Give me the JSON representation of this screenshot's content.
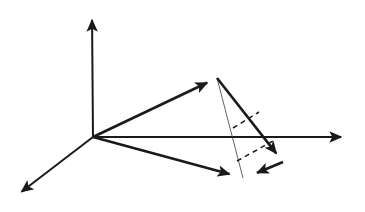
{
  "figure": {
    "type": "line-diagram",
    "background_color": "#ffffff",
    "width": 365,
    "height": 212,
    "origin": {
      "x": 93,
      "y": 137,
      "label": "O"
    }
  },
  "chart_data": {
    "type": "line",
    "title": "",
    "xlabel": "",
    "ylabel": "",
    "grid": false,
    "legend": "none",
    "axes": [
      {
        "name": "y-axis",
        "direction": "up",
        "from": {
          "x": 93,
          "y": 137
        },
        "to": {
          "x": 92,
          "y": 13
        },
        "arrow": true,
        "stroke": "#1a1a1a",
        "width": 2.0
      },
      {
        "name": "x-axis",
        "direction": "right",
        "from": {
          "x": 93,
          "y": 137
        },
        "to": {
          "x": 348,
          "y": 137
        },
        "arrow": true,
        "stroke": "#1a1a1a",
        "width": 2.0
      },
      {
        "name": "z-axis",
        "direction": "down-left",
        "from": {
          "x": 93,
          "y": 137
        },
        "to": {
          "x": 16,
          "y": 196
        },
        "arrow": true,
        "stroke": "#1a1a1a",
        "width": 2.0
      }
    ],
    "vectors": [
      {
        "name": "upper-vector",
        "from": {
          "x": 93,
          "y": 137
        },
        "to": {
          "x": 217,
          "y": 78
        },
        "arrow": true,
        "stroke": "#1a1a1a",
        "width": 2.6,
        "style": "solid"
      },
      {
        "name": "lower-vector",
        "from": {
          "x": 93,
          "y": 137
        },
        "to": {
          "x": 240,
          "y": 177
        },
        "arrow": true,
        "stroke": "#1a1a1a",
        "width": 2.6,
        "style": "solid"
      }
    ],
    "edges": [
      {
        "name": "apex-to-right-edge",
        "from": {
          "x": 217,
          "y": 78
        },
        "to": {
          "x": 283,
          "y": 162
        },
        "arrow": true,
        "stroke": "#1a1a1a",
        "width": 2.6,
        "style": "solid"
      },
      {
        "name": "right-to-base-edge",
        "from": {
          "x": 283,
          "y": 162
        },
        "to": {
          "x": 247,
          "y": 177
        },
        "arrow": true,
        "stroke": "#1a1a1a",
        "width": 2.6,
        "style": "solid"
      },
      {
        "name": "apex-to-base-thin-edge",
        "from": {
          "x": 217,
          "y": 78
        },
        "to": {
          "x": 243,
          "y": 178
        },
        "arrow": false,
        "stroke": "#3a3a3a",
        "width": 0.8,
        "style": "solid"
      }
    ],
    "hidden_edges": [
      {
        "name": "upper-hidden-edge",
        "from": {
          "x": 233,
          "y": 128
        },
        "to": {
          "x": 259,
          "y": 112
        },
        "stroke": "#1a1a1a",
        "width": 1.5,
        "style": "dashed",
        "dash_pattern": "5,4"
      },
      {
        "name": "lower-hidden-edge",
        "from": {
          "x": 237,
          "y": 161
        },
        "to": {
          "x": 273,
          "y": 141
        },
        "stroke": "#1a1a1a",
        "width": 1.5,
        "style": "dashed",
        "dash_pattern": "5,4"
      }
    ],
    "vertices": [
      {
        "name": "origin",
        "x": 93,
        "y": 137
      },
      {
        "name": "apex",
        "x": 217,
        "y": 78
      },
      {
        "name": "base-left",
        "x": 241,
        "y": 177
      },
      {
        "name": "base-right",
        "x": 283,
        "y": 162
      }
    ],
    "colors": {
      "stroke": "#1a1a1a",
      "thin_stroke": "#3a3a3a",
      "background": "#ffffff"
    }
  }
}
